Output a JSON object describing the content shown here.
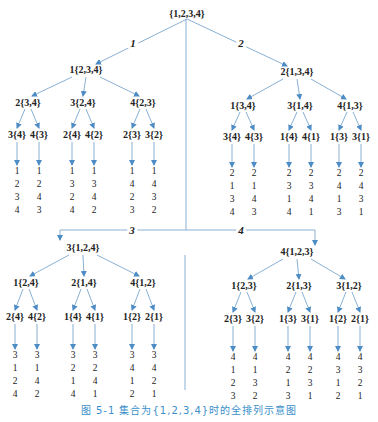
{
  "diagram": {
    "type": "permutation-tree",
    "root": "{1,2,3,4}",
    "edge_labels": [
      "1",
      "2",
      "3",
      "4"
    ],
    "colors": {
      "line": "#7aa7cf",
      "arrow": "#4d8cc4",
      "text": "#222222",
      "caption": "#3b8fc9"
    },
    "branches": [
      {
        "label": "1{2,3,4}",
        "children": [
          {
            "label": "2{3,4}",
            "children": [
              {
                "label": "3{4}",
                "perm": [
                  "1",
                  "2",
                  "3",
                  "4"
                ]
              },
              {
                "label": "4{3}",
                "perm": [
                  "1",
                  "2",
                  "4",
                  "3"
                ]
              }
            ]
          },
          {
            "label": "3{2,4}",
            "children": [
              {
                "label": "2{4}",
                "perm": [
                  "1",
                  "3",
                  "2",
                  "4"
                ]
              },
              {
                "label": "4{2}",
                "perm": [
                  "1",
                  "3",
                  "4",
                  "2"
                ]
              }
            ]
          },
          {
            "label": "4{2,3}",
            "children": [
              {
                "label": "2{3}",
                "perm": [
                  "1",
                  "4",
                  "2",
                  "3"
                ]
              },
              {
                "label": "3{2}",
                "perm": [
                  "1",
                  "4",
                  "3",
                  "2"
                ]
              }
            ]
          }
        ]
      },
      {
        "label": "2{1,3,4}",
        "children": [
          {
            "label": "1{3,4}",
            "children": [
              {
                "label": "3{4}",
                "perm": [
                  "2",
                  "1",
                  "3",
                  "4"
                ]
              },
              {
                "label": "4{3}",
                "perm": [
                  "2",
                  "1",
                  "4",
                  "3"
                ]
              }
            ]
          },
          {
            "label": "3{1,4}",
            "children": [
              {
                "label": "1{4}",
                "perm": [
                  "2",
                  "3",
                  "1",
                  "4"
                ]
              },
              {
                "label": "4{1}",
                "perm": [
                  "2",
                  "3",
                  "4",
                  "1"
                ]
              }
            ]
          },
          {
            "label": "4{1,3}",
            "children": [
              {
                "label": "1{3}",
                "perm": [
                  "2",
                  "4",
                  "1",
                  "3"
                ]
              },
              {
                "label": "3{1}",
                "perm": [
                  "2",
                  "4",
                  "3",
                  "1"
                ]
              }
            ]
          }
        ]
      },
      {
        "label": "3{1,2,4}",
        "children": [
          {
            "label": "1{2,4}",
            "children": [
              {
                "label": "2{4}",
                "perm": [
                  "3",
                  "1",
                  "2",
                  "4"
                ]
              },
              {
                "label": "4{2}",
                "perm": [
                  "3",
                  "1",
                  "4",
                  "2"
                ]
              }
            ]
          },
          {
            "label": "2{1,4}",
            "children": [
              {
                "label": "1{4}",
                "perm": [
                  "3",
                  "2",
                  "1",
                  "4"
                ]
              },
              {
                "label": "4{1}",
                "perm": [
                  "3",
                  "2",
                  "4",
                  "1"
                ]
              }
            ]
          },
          {
            "label": "4{1,2}",
            "children": [
              {
                "label": "1{2}",
                "perm": [
                  "3",
                  "4",
                  "1",
                  "2"
                ]
              },
              {
                "label": "2{1}",
                "perm": [
                  "3",
                  "4",
                  "2",
                  "1"
                ]
              }
            ]
          }
        ]
      },
      {
        "label": "4{1,2,3}",
        "children": [
          {
            "label": "1{2,3}",
            "children": [
              {
                "label": "2{3}",
                "perm": [
                  "4",
                  "1",
                  "2",
                  "3"
                ]
              },
              {
                "label": "3{2}",
                "perm": [
                  "4",
                  "1",
                  "3",
                  "2"
                ]
              }
            ]
          },
          {
            "label": "2{1,3}",
            "children": [
              {
                "label": "1{3}",
                "perm": [
                  "4",
                  "2",
                  "1",
                  "3"
                ]
              },
              {
                "label": "3{1}",
                "perm": [
                  "4",
                  "2",
                  "3",
                  "1"
                ]
              }
            ]
          },
          {
            "label": "3{1,2}",
            "children": [
              {
                "label": "1{2}",
                "perm": [
                  "4",
                  "3",
                  "1",
                  "2"
                ]
              },
              {
                "label": "2{1}",
                "perm": [
                  "4",
                  "3",
                  "2",
                  "1"
                ]
              }
            ]
          }
        ]
      }
    ]
  },
  "caption": "图 5-1   集合为{1,2,3,4}时的全排列示意图"
}
